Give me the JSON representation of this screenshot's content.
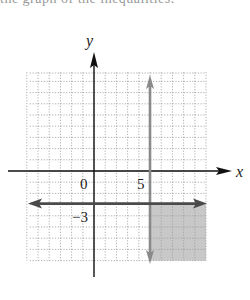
{
  "header": {
    "text": "the graph of the inequalities."
  },
  "chart_data": {
    "type": "region",
    "title": "",
    "xlabel": "x",
    "ylabel": "y",
    "xlim": [
      -6,
      10
    ],
    "ylim": [
      -8,
      9
    ],
    "grid": true,
    "tick_labels": [
      {
        "text": "0",
        "position": "origin"
      },
      {
        "text": "5",
        "x": 5
      },
      {
        "text": "−3",
        "y": -3
      }
    ],
    "boundary_lines": [
      {
        "equation": "x = 5",
        "orientation": "vertical",
        "value": 5,
        "color": "#8a8a8a"
      },
      {
        "equation": "y = -3",
        "orientation": "horizontal",
        "value": -3,
        "color": "#4a4a4a"
      }
    ],
    "shaded_region": {
      "x_range": [
        5,
        10
      ],
      "y_range": [
        -8,
        -3
      ],
      "description": "x >= 5 and y <= -3",
      "color": "#c8c8c8"
    }
  },
  "colors": {
    "grid": "#9a9a9a",
    "axis": "#111111",
    "shade": "#c8c8c8",
    "line_vertical": "#8a8a8a",
    "line_horizontal": "#4a4a4a"
  }
}
